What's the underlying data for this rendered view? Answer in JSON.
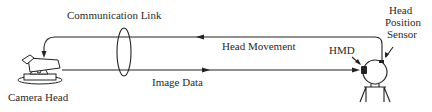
{
  "labels": {
    "communication_link": "Communication Link",
    "head_movement": "Head Movement",
    "image_data": "Image Data",
    "camera_head": "Camera Head",
    "hmd": "HMD",
    "head_position_sensor_1": "Head",
    "head_position_sensor_2": "Position",
    "head_position_sensor_3": "Sensor"
  },
  "colors": {
    "stroke": "#222222",
    "background": "#ffffff"
  }
}
